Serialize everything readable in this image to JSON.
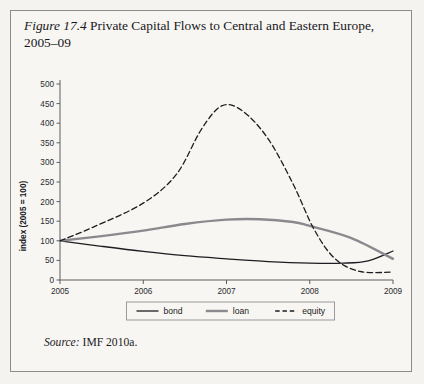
{
  "figure": {
    "label": "Figure 17.4",
    "title": "Private Capital Flows to Central and Eastern Europe, 2005–09",
    "source_label": "Source:",
    "source_text": "IMF 2010a."
  },
  "colors": {
    "page_background": "#f4f3f0",
    "frame_border": "#8d8c88",
    "axis": "#5d5d61",
    "bond": "#1d1d21",
    "loan": "#8a8a8e",
    "equity": "#1d1d21",
    "text": "#17161a"
  },
  "chart_data": {
    "type": "line",
    "title": "",
    "xlabel": "",
    "ylabel": "index (2005 = 100)",
    "xlim": [
      2005,
      2009
    ],
    "ylim": [
      0,
      500
    ],
    "grid": false,
    "legend_position": "bottom",
    "x_ticks": [
      "2005",
      "2006",
      "2007",
      "2008",
      "2009"
    ],
    "y_ticks": [
      "0",
      "50",
      "100",
      "150",
      "200",
      "250",
      "300",
      "350",
      "400",
      "450",
      "500"
    ],
    "x": [
      2005,
      2009
    ],
    "series": [
      {
        "name": "bond",
        "style": "solid-thin",
        "color": "#1d1d21",
        "points": [
          [
            2005.0,
            100
          ],
          [
            2005.5,
            86
          ],
          [
            2006.0,
            73
          ],
          [
            2006.5,
            62
          ],
          [
            2007.0,
            54
          ],
          [
            2007.5,
            47
          ],
          [
            2008.0,
            43
          ],
          [
            2008.4,
            43
          ],
          [
            2008.7,
            49
          ],
          [
            2009.0,
            74
          ]
        ]
      },
      {
        "name": "loan",
        "style": "solid-thick",
        "color": "#8a8a8e",
        "points": [
          [
            2005.0,
            100
          ],
          [
            2005.5,
            112
          ],
          [
            2006.0,
            126
          ],
          [
            2006.5,
            143
          ],
          [
            2007.0,
            154
          ],
          [
            2007.4,
            155
          ],
          [
            2007.8,
            148
          ],
          [
            2008.0,
            138
          ],
          [
            2008.5,
            107
          ],
          [
            2009.0,
            54
          ]
        ]
      },
      {
        "name": "equity",
        "style": "dashed",
        "color": "#1d1d21",
        "points": [
          [
            2005.0,
            100
          ],
          [
            2005.4,
            135
          ],
          [
            2006.0,
            196
          ],
          [
            2006.4,
            270
          ],
          [
            2006.7,
            385
          ],
          [
            2006.95,
            445
          ],
          [
            2007.2,
            430
          ],
          [
            2007.5,
            360
          ],
          [
            2007.8,
            245
          ],
          [
            2008.05,
            130
          ],
          [
            2008.3,
            55
          ],
          [
            2008.6,
            22
          ],
          [
            2009.0,
            20
          ]
        ]
      }
    ],
    "legend": [
      {
        "label": "bond",
        "style": "solid-thin",
        "color": "#1d1d21"
      },
      {
        "label": "loan",
        "style": "solid-thick",
        "color": "#8a8a8e"
      },
      {
        "label": "equity",
        "style": "dashed",
        "color": "#1d1d21"
      }
    ]
  }
}
